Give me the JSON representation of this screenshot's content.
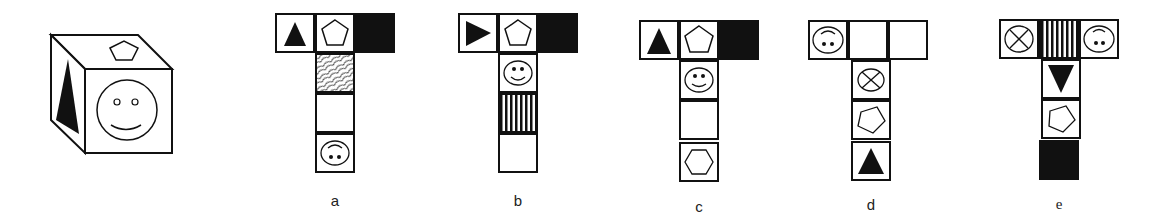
{
  "puzzle": {
    "description": "Cube with three visible faces (pentagon on top, triangle on left, smiley on front); choose the net that folds into it",
    "cube": {
      "top_face": "pentagon",
      "left_face": "filled-triangle",
      "front_face": "smiley"
    },
    "options": [
      {
        "label": "a",
        "cells": [
          "filled-triangle-up",
          "pentagon",
          "black",
          "crosshatch",
          "blank",
          "inverted-smiley"
        ]
      },
      {
        "label": "b",
        "cells": [
          "filled-triangle-right",
          "pentagon",
          "black",
          "smiley",
          "vertical-stripes",
          "blank"
        ]
      },
      {
        "label": "c",
        "cells": [
          "filled-triangle-up",
          "pentagon",
          "black",
          "smiley",
          "blank",
          "hexagon"
        ]
      },
      {
        "label": "d",
        "cells": [
          "inverted-smiley",
          "blank",
          "blank",
          "circle-x",
          "pentagon-rotated",
          "filled-triangle-up"
        ]
      },
      {
        "label": "e",
        "cells": [
          "circle-x",
          "vertical-stripes",
          "inverted-smiley",
          "filled-triangle-down",
          "pentagon-rotated",
          "black"
        ]
      }
    ]
  }
}
